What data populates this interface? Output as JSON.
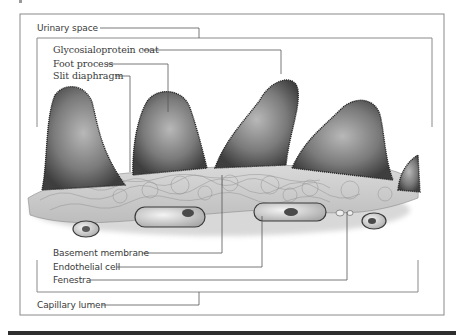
{
  "figure": {
    "labels": {
      "urinary_space": "Urinary space",
      "glycosialoprotein_coat": "Glycosialoprotein coat",
      "foot_process": "Foot process",
      "slit_diaphragm": "Slit diaphragm",
      "basement_membrane": "Basement membrane",
      "endothelial_cell": "Endothelial cell",
      "fenestra": "Fenestra",
      "capillary_lumen": "Capillary lumen"
    },
    "colors": {
      "frame": "#8a8a8a",
      "leader_line": "#555555",
      "text": "#3a3a3a",
      "foot_process_fill": "#6e6e6e",
      "membrane_fill": "#cfcfcf",
      "bottom_bar": "#2e2e2e"
    }
  }
}
